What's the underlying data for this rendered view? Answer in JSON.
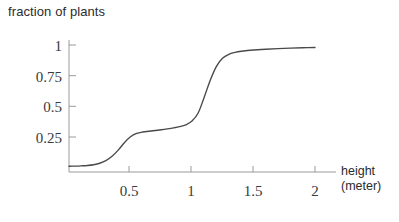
{
  "chart_data": {
    "type": "line",
    "title": "fraction of plants",
    "xlabel": "height",
    "xlabel_units": "(meter)",
    "ylabel": "",
    "xlim": [
      0,
      2.16
    ],
    "ylim": [
      0,
      1.06
    ],
    "grid": false,
    "legend": "none",
    "xticks": [
      0.5,
      1,
      1.5,
      2
    ],
    "xtick_labels": [
      "0.5",
      "1",
      "1.5",
      "2"
    ],
    "yticks": [
      0.25,
      0.5,
      0.75,
      1
    ],
    "ytick_labels": [
      "0.25",
      "0.5",
      "0.75",
      "1"
    ],
    "line_color": "#4a4a4a",
    "axis_color": "#9a9a9a",
    "series": [
      {
        "name": "cumulative fraction of plants",
        "x": [
          0.0,
          0.05,
          0.1,
          0.15,
          0.2,
          0.25,
          0.3,
          0.35,
          0.4,
          0.45,
          0.5,
          0.55,
          0.6,
          0.65,
          0.7,
          0.75,
          0.8,
          0.85,
          0.9,
          0.95,
          1.0,
          1.05,
          1.1,
          1.15,
          1.2,
          1.25,
          1.3,
          1.35,
          1.4,
          1.45,
          1.5,
          1.6,
          1.7,
          1.8,
          1.9,
          2.0
        ],
        "y": [
          0.02,
          0.021,
          0.023,
          0.026,
          0.032,
          0.044,
          0.065,
          0.1,
          0.15,
          0.21,
          0.258,
          0.285,
          0.297,
          0.303,
          0.309,
          0.315,
          0.322,
          0.33,
          0.34,
          0.355,
          0.385,
          0.45,
          0.58,
          0.72,
          0.83,
          0.895,
          0.925,
          0.94,
          0.95,
          0.956,
          0.96,
          0.966,
          0.971,
          0.975,
          0.978,
          0.98
        ]
      }
    ],
    "annotations": []
  },
  "axis_label": {
    "line1": "height",
    "line2": "(meter)"
  }
}
